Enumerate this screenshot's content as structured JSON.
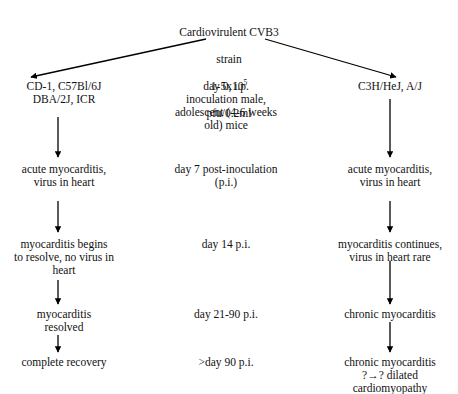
{
  "figure": {
    "width": 458,
    "height": 394,
    "background": "#ffffff",
    "ink": "#000000",
    "type": "flowchart",
    "title_node": {
      "line1": "Cardiovirulent CVB3",
      "line2": "strain",
      "line3_base": "1-5x10",
      "line3_sup": "5",
      "line4": "pfu/0.2ml"
    },
    "columns": {
      "left": {
        "header": "CD-1, C57Bl/6J\nDBA/2J, ICR",
        "steps": [
          "acute myocarditis,\nvirus in heart",
          "myocarditis begins\nto resolve, no virus in\nheart",
          "myocarditis\nresolved",
          "complete recovery"
        ]
      },
      "middle": {
        "header": "day 0, i.p.\ninoculation male,\nadolescent (4-6 weeks\nold) mice",
        "steps": [
          "day 7 post-inoculation\n(p.i.)",
          "day 14 p.i.",
          "day 21-90 p.i.",
          ">day 90 p.i."
        ]
      },
      "right": {
        "header": "C3H/HeJ, A/J",
        "steps": [
          "acute myocarditis,\nvirus in heart",
          "myocarditis continues,\nvirus in heart rare",
          "chronic myocarditis",
          "chronic myocarditis\n?→? dilated\ncardiomyopathy"
        ]
      }
    },
    "arrows": [
      {
        "name": "branch-left",
        "x1": 206,
        "y1": 39,
        "x2": 31,
        "y2": 77
      },
      {
        "name": "branch-right",
        "x1": 265,
        "y1": 39,
        "x2": 396,
        "y2": 77
      },
      {
        "name": "left-header-to-step1",
        "x1": 58,
        "y1": 117,
        "x2": 58,
        "y2": 157
      },
      {
        "name": "left-step1-to-step2",
        "x1": 58,
        "y1": 201,
        "x2": 58,
        "y2": 232
      },
      {
        "name": "left-step2-to-step3",
        "x1": 58,
        "y1": 280,
        "x2": 58,
        "y2": 304
      },
      {
        "name": "left-step3-to-step4",
        "x1": 58,
        "y1": 335,
        "x2": 58,
        "y2": 352
      },
      {
        "name": "right-header-to-step1",
        "x1": 390,
        "y1": 99,
        "x2": 390,
        "y2": 157
      },
      {
        "name": "right-step1-to-step2",
        "x1": 390,
        "y1": 201,
        "x2": 390,
        "y2": 232
      },
      {
        "name": "right-step2-to-step3",
        "x1": 390,
        "y1": 261,
        "x2": 390,
        "y2": 304
      },
      {
        "name": "right-step3-to-step4",
        "x1": 390,
        "y1": 322,
        "x2": 390,
        "y2": 352
      }
    ]
  }
}
